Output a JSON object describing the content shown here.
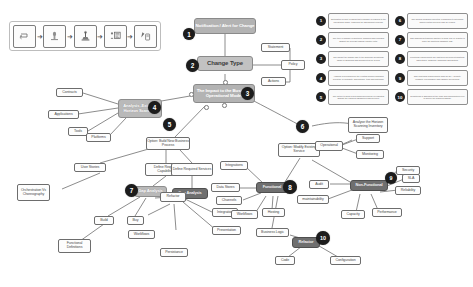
{
  "diagram": {
    "colors": {
      "node_gray": "#b9b9b9",
      "node_dark": "#6f6f6f",
      "badge": "#1c1c1c",
      "line": "#6f6f6f",
      "plain_border": "#6d6d6d",
      "background": "#ffffff"
    }
  },
  "icon_strip": {
    "name": "process-icon-legend",
    "arrow": "➜",
    "items": [
      {
        "icon": "return-arrow-icon"
      },
      {
        "icon": "document-scan-icon"
      },
      {
        "icon": "microscope-icon"
      },
      {
        "icon": "person-chart-icon"
      },
      {
        "icon": "pen-tablet-icon"
      }
    ]
  },
  "nodes": {
    "notification": "Notification / Alert for Change",
    "change_type": "Change Type",
    "impact": "The Impact to the Business Operational Model",
    "statement": "Statement",
    "policy": "Policy",
    "actions": "Actions",
    "analysis_existing": "Analysis -Existing Horizon Scanning",
    "contracts": "Contracts",
    "applications": "Applications",
    "tools": "Tools",
    "platforms": "Platforms",
    "option_build": "Option: Build New Business Process",
    "define_capabilities": "Define Required Capabilities",
    "define_services": "Define Required Services",
    "user_stories": "User Stories",
    "orchestration": "Orchestration Vs Choreography",
    "gap_analysis_left": "Gap Analysis",
    "gap_analysis_right": "Gap Analysis",
    "build": "Build",
    "buy": "Buy",
    "refactor_left": "Refactor",
    "functional_definitions": "Functional Definitions",
    "workflows_left": "Workflows",
    "persistance": "Persistance",
    "integration": "Integration",
    "presentation": "Presentation",
    "analyse_inventory": "Analyse the Horizon Scanning Inventory",
    "option_modify": "Option: Modify Existing Service",
    "operational": "Operational",
    "support": "Support",
    "monitoring": "Monitoring",
    "functional": "Functional",
    "integrations": "Integrations",
    "data_stores": "Data Stores",
    "channels": "Channels",
    "workflows_right": "Workflows",
    "hosting": "Hosting",
    "business_logic": "Business Logic",
    "non_functional": "Non-Functional",
    "audit": "Audit",
    "maintainability": "maintainability",
    "capacity": "Capacity",
    "performance": "Performance",
    "reliability": "Reliability",
    "security": "Security",
    "sla": "SLA",
    "refactor_right": "Refactor",
    "code": "Code",
    "configuration": "Configuration"
  },
  "badges": {
    "b1": "1",
    "b2": "2",
    "b3": "3",
    "b4": "4",
    "b5": "5",
    "b6": "6",
    "b7": "7",
    "b8": "8",
    "b9": "9",
    "b10": "10"
  },
  "legend": {
    "left_column": [
      {
        "num": "1",
        "text": "Notification or alert is raised that a change is required to the operational model, triggering the assessment process."
      },
      {
        "num": "2",
        "text": "The type of change is identified, classified and recorded against the relevant change register entry."
      },
      {
        "num": "3",
        "text": "The impact the change has to the business operational model is assessed and documented for review."
      },
      {
        "num": "4",
        "text": "Analysis is performed on the existing horizon scanning inventory of contracts, applications, tools and platforms."
      },
      {
        "num": "5",
        "text": "The option to build a new business process is evaluated against the required capabilities and services."
      }
    ],
    "right_column": [
      {
        "num": "6",
        "text": "The horizon scanning inventory is analysed to determine which existing services may be reused."
      },
      {
        "num": "7",
        "text": "Gap analysis determines whether to build, buy or refactor to close the identified capability gap."
      },
      {
        "num": "8",
        "text": "Functional requirements are captured covering integrations, data stores, channels, workflows and hosting."
      },
      {
        "num": "9",
        "text": "Non-functional requirements such as SLA, security, reliability, performance and capacity are defined."
      },
      {
        "num": "10",
        "text": "Refactoring is assessed at the code and configuration level to deliver the required change."
      }
    ]
  }
}
